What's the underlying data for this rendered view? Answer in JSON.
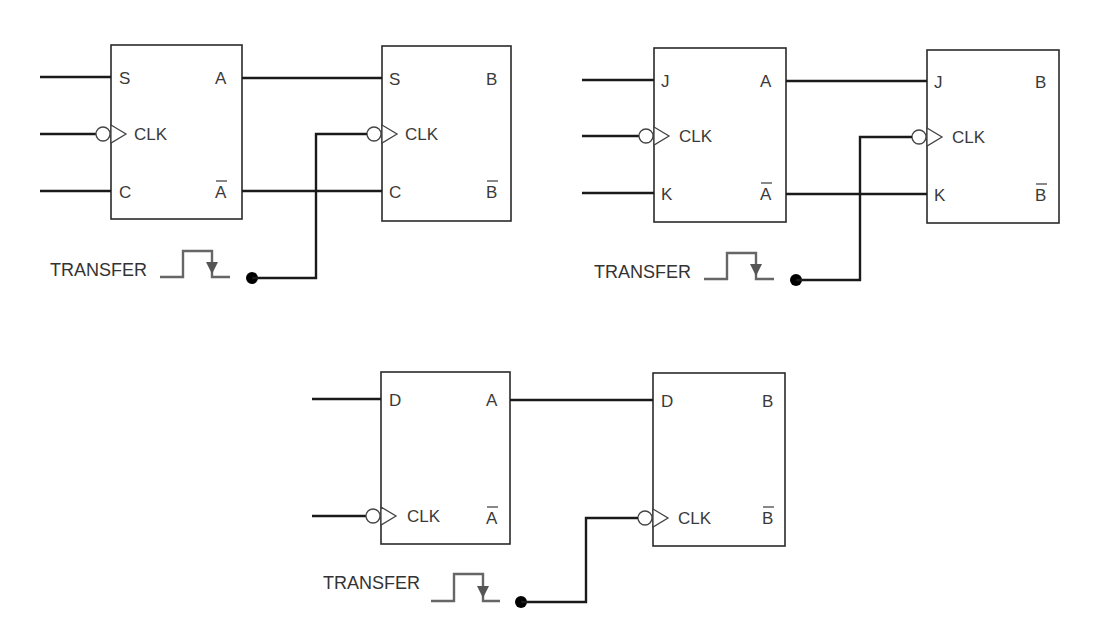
{
  "diagram": {
    "circuits": [
      {
        "type": "SC",
        "source": {
          "name": "A",
          "inputs": {
            "top": "S",
            "clock": "CLK",
            "bottom": "C"
          },
          "outputs": {
            "top": "A",
            "bottom": "A",
            "bottom_inverted": true
          }
        },
        "dest": {
          "name": "B",
          "inputs": {
            "top": "S",
            "clock": "CLK",
            "bottom": "C"
          },
          "outputs": {
            "top": "B",
            "bottom": "B",
            "bottom_inverted": true
          }
        },
        "transfer_label": "TRANSFER"
      },
      {
        "type": "JK",
        "source": {
          "name": "A",
          "inputs": {
            "top": "J",
            "clock": "CLK",
            "bottom": "K"
          },
          "outputs": {
            "top": "A",
            "bottom": "A",
            "bottom_inverted": true
          }
        },
        "dest": {
          "name": "B",
          "inputs": {
            "top": "J",
            "clock": "CLK",
            "bottom": "K"
          },
          "outputs": {
            "top": "B",
            "bottom": "B",
            "bottom_inverted": true
          }
        },
        "transfer_label": "TRANSFER"
      },
      {
        "type": "D",
        "source": {
          "name": "A",
          "inputs": {
            "top": "D",
            "clock": "CLK"
          },
          "outputs": {
            "top": "A",
            "bottom": "A",
            "bottom_inverted": true
          }
        },
        "dest": {
          "name": "B",
          "inputs": {
            "top": "D",
            "clock": "CLK"
          },
          "outputs": {
            "top": "B",
            "bottom": "B",
            "bottom_inverted": true
          }
        },
        "transfer_label": "TRANSFER"
      }
    ],
    "colors": {
      "wire": "#1a1a1a",
      "box": "#2a2a2a",
      "pulse": "#666666",
      "text": "#3a3a3a"
    }
  }
}
